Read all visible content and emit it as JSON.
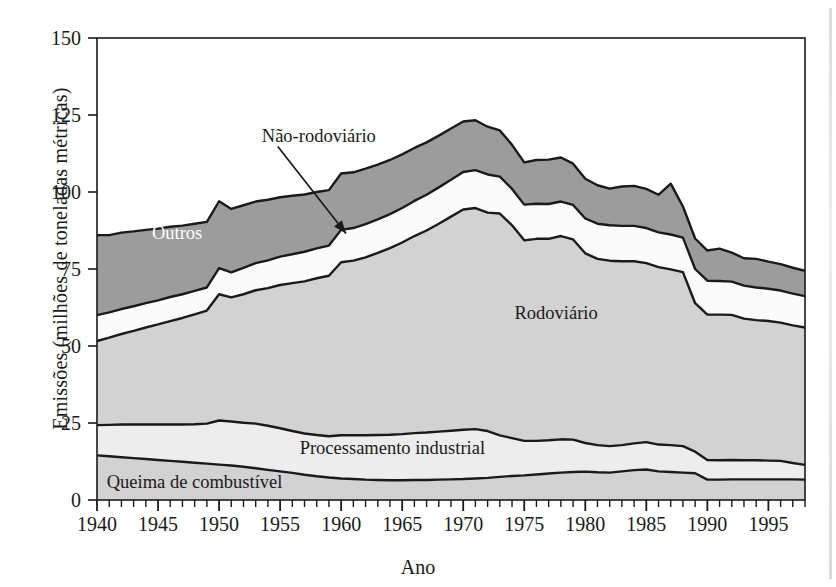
{
  "chart_data": {
    "type": "area",
    "title": "",
    "xlabel": "Ano",
    "ylabel": "Emissões (milhões de toneladas métricas)",
    "xlim": [
      1940,
      1998
    ],
    "ylim": [
      0,
      150
    ],
    "grid": false,
    "stacked": true,
    "legend_position": "inline-annotations",
    "y_ticks": [
      0,
      25,
      50,
      75,
      100,
      125,
      150
    ],
    "x_ticks": [
      1940,
      1945,
      1950,
      1955,
      1960,
      1965,
      1970,
      1975,
      1980,
      1985,
      1990,
      1995
    ],
    "x_minor_tick_step": 1,
    "x": [
      1940,
      1941,
      1942,
      1943,
      1944,
      1945,
      1946,
      1947,
      1948,
      1949,
      1950,
      1951,
      1952,
      1953,
      1954,
      1955,
      1956,
      1957,
      1958,
      1959,
      1960,
      1961,
      1962,
      1963,
      1964,
      1965,
      1966,
      1967,
      1968,
      1969,
      1970,
      1971,
      1972,
      1973,
      1974,
      1975,
      1976,
      1977,
      1978,
      1979,
      1980,
      1981,
      1982,
      1983,
      1984,
      1985,
      1986,
      1987,
      1988,
      1989,
      1990,
      1991,
      1992,
      1993,
      1994,
      1995,
      1996,
      1997,
      1998
    ],
    "series": [
      {
        "name": "Queima de combustível",
        "color": "#d2d2d2",
        "values": [
          14.5,
          14.2,
          13.9,
          13.6,
          13.3,
          13.0,
          12.7,
          12.4,
          12.1,
          11.8,
          11.5,
          11.2,
          10.8,
          10.3,
          9.8,
          9.3,
          8.8,
          8.2,
          7.7,
          7.3,
          7.0,
          6.8,
          6.6,
          6.5,
          6.4,
          6.4,
          6.5,
          6.5,
          6.6,
          6.7,
          6.8,
          7.0,
          7.2,
          7.5,
          7.8,
          8.0,
          8.3,
          8.6,
          8.9,
          9.1,
          9.2,
          9.0,
          8.9,
          9.3,
          9.7,
          9.9,
          9.3,
          9.1,
          8.9,
          8.7,
          6.6,
          6.6,
          6.7,
          6.7,
          6.7,
          6.7,
          6.7,
          6.7,
          6.6
        ]
      },
      {
        "name": "Processamento industrial",
        "color": "#ededed",
        "values": [
          9.8,
          10.2,
          10.6,
          10.9,
          11.2,
          11.5,
          11.8,
          12.1,
          12.5,
          13.0,
          14.3,
          14.3,
          14.3,
          14.5,
          14.3,
          14.0,
          13.6,
          13.4,
          13.4,
          13.4,
          14.0,
          14.2,
          14.4,
          14.6,
          14.8,
          15.0,
          15.2,
          15.4,
          15.6,
          15.8,
          16.0,
          16.0,
          15.2,
          13.5,
          12.3,
          11.2,
          10.9,
          10.8,
          10.8,
          10.5,
          9.3,
          8.8,
          8.6,
          8.5,
          8.7,
          8.9,
          8.7,
          8.7,
          8.6,
          7.0,
          6.4,
          6.3,
          6.3,
          6.2,
          6.2,
          6.1,
          6.0,
          5.3,
          4.8
        ]
      },
      {
        "name": "Rodoviário",
        "color": "#d2d2d2",
        "values": [
          27.3,
          28.3,
          29.4,
          30.4,
          31.5,
          32.5,
          33.6,
          34.6,
          35.7,
          36.7,
          41.0,
          40.3,
          41.7,
          43.3,
          44.7,
          46.5,
          48.0,
          49.4,
          50.9,
          52.1,
          56.2,
          56.7,
          57.8,
          59.1,
          60.6,
          62.2,
          64.0,
          65.6,
          67.5,
          69.5,
          71.5,
          71.8,
          70.9,
          72.0,
          69.1,
          65.1,
          65.6,
          65.4,
          66.0,
          65.0,
          61.6,
          60.5,
          60.2,
          59.7,
          59.1,
          58.1,
          57.6,
          57.1,
          56.5,
          48.2,
          47.2,
          47.3,
          47.1,
          46.0,
          45.5,
          45.3,
          44.9,
          44.7,
          44.6
        ]
      },
      {
        "name": "Não-rodoviário",
        "color": "#fbfbfb",
        "values": [
          8.4,
          8.2,
          8.1,
          8.0,
          7.9,
          7.8,
          7.8,
          7.7,
          7.6,
          7.5,
          8.5,
          8.1,
          8.6,
          8.8,
          9.0,
          9.2,
          9.4,
          9.6,
          9.7,
          9.8,
          10.5,
          10.6,
          10.8,
          10.9,
          11.0,
          11.2,
          11.4,
          11.6,
          11.8,
          12.0,
          12.2,
          12.3,
          12.4,
          12.0,
          11.8,
          11.6,
          11.4,
          11.3,
          11.2,
          11.2,
          11.3,
          11.4,
          11.5,
          11.5,
          11.5,
          11.4,
          11.3,
          11.3,
          11.2,
          11.1,
          11.0,
          10.9,
          10.8,
          10.7,
          10.6,
          10.5,
          10.4,
          10.3,
          10.2
        ]
      },
      {
        "name": "Outros",
        "color": "#9c9c9c",
        "values": [
          26.0,
          25.1,
          24.8,
          24.3,
          23.8,
          23.3,
          22.8,
          22.3,
          21.8,
          21.3,
          21.7,
          20.6,
          20.3,
          20.0,
          19.7,
          19.3,
          19.0,
          18.6,
          18.3,
          18.0,
          18.3,
          18.1,
          18.0,
          17.8,
          17.6,
          17.4,
          17.2,
          17.0,
          16.8,
          16.6,
          16.4,
          16.2,
          15.5,
          15.0,
          14.3,
          13.7,
          14.2,
          14.4,
          14.3,
          13.4,
          12.9,
          12.5,
          11.9,
          12.8,
          13.0,
          12.7,
          12.2,
          16.5,
          10.1,
          9.9,
          9.8,
          10.5,
          9.4,
          8.9,
          9.3,
          8.8,
          8.6,
          8.4,
          8.2
        ]
      }
    ],
    "annotations": [
      {
        "name": "nao-rodoviario",
        "text": "Não-rodoviário",
        "x": 1953.5,
        "y": 118,
        "arrow_to_x": 1960.4,
        "arrow_to_y": 86.5
      },
      {
        "name": "outros",
        "text": "Outros",
        "x": 1944.5,
        "y": 86.5
      },
      {
        "name": "rodoviario",
        "text": "Rodoviário",
        "x": 1974.2,
        "y": 60.5
      },
      {
        "name": "processamento-industrial",
        "text": "Processamento industrial",
        "x": 1956.6,
        "y": 16.5
      },
      {
        "name": "queima-de-combustivel",
        "text": "Queima de combustível",
        "x": 1940.8,
        "y": 5.5
      }
    ]
  },
  "axes": {
    "y_title": "Emissões (milhões de toneladas métricas)",
    "x_title": "Ano",
    "y_tick_labels": [
      "150",
      "125",
      "100",
      "75",
      "50",
      "25",
      "0"
    ],
    "x_tick_labels": [
      "1940",
      "1945",
      "1950",
      "1955",
      "1960",
      "1965",
      "1970",
      "1975",
      "1980",
      "1985",
      "1990",
      "1995"
    ]
  },
  "labels": {
    "nao_rodoviario": "Não-rodoviário",
    "outros": "Outros",
    "rodoviario": "Rodoviário",
    "processamento_industrial": "Processamento industrial",
    "queima_de_combustivel": "Queima de combustível"
  },
  "colors": {
    "axis": "#1a1a1a",
    "outline": "#1a1a1a",
    "outros_fill": "#9c9c9c",
    "rodoviario_fill": "#d2d2d2",
    "nao_rodoviario_fill": "#fbfbfb",
    "processamento_fill": "#ededed",
    "queima_fill": "#d2d2d2",
    "background": "#ffffff"
  }
}
